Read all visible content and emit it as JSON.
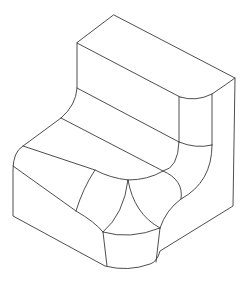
{
  "figure": {
    "description": "Isometric wireframe line drawing of a filleted L-shaped (stepped) solid",
    "view": "isometric",
    "stroke_color": "#3a3a3a",
    "background": "#ffffff",
    "width": 249,
    "height": 284
  },
  "edges": {
    "outline": "M114 15 L235 78 L233 206 L160 251 Q157 262 150 264 Q128 272 105 266 L13 216 L13 170 Q13 152 23 146 L61 118 Q76 105 77 88 L77 43 Z",
    "top_face_front_edge": "M77 43 L180 97",
    "top_right_fillet_top": "M180 97 Q196 102 212 94 Q224 86 235 78",
    "upper_step_edge": "M77 88 L179 142",
    "right_fillet_left_vertical": "M179 97 L179 142",
    "right_fillet_right_vertical": "M212 94 L212 145",
    "right_fillet_bottom_arc": "M179 142 Q196 149 212 145",
    "middle_step_edge": "M61 118 L163 171",
    "lower_step_edge": "M23 146 L95 170 Q110 178 128 180",
    "left_diagonal_edge": "M13 166 L76 211 Q95 222 103 232",
    "left_curved_divider": "M95 170 Q83 188 76 211",
    "inner_concave_arc": "M179 142 Q178 168 163 171 Q148 180 128 180",
    "cusp_left_arc": "M128 180 Q124 214 103 232",
    "cusp_right_arc": "M128 180 Q134 214 160 228",
    "right_lower_arc": "M163 171 Q184 180 181 199",
    "right_corner_arc": "M212 145 Q212 182 181 199 Q166 210 160 228",
    "cusp_base_arc": "M103 232 Q130 240 160 228",
    "front_left_vertical": "M103 232 L107 266",
    "front_right_vertical": "M160 228 L156 262"
  }
}
